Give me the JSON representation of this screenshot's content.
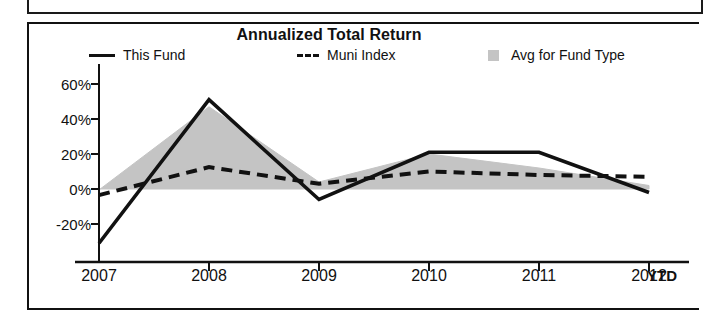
{
  "panel": {
    "frame_color": "#111111"
  },
  "chart_data": {
    "type": "line",
    "title": "Annualized Total Return",
    "xlabel": "",
    "ylabel": "",
    "x": [
      "2007",
      "2008",
      "2009",
      "2010",
      "2011",
      "2012"
    ],
    "categories": [
      "2007",
      "2008",
      "2009",
      "2010",
      "2011",
      "2012"
    ],
    "x_axis_note": "YTD",
    "ylim": [
      -32,
      62
    ],
    "yticks": [
      60,
      40,
      20,
      0,
      -20
    ],
    "ytick_labels": [
      "60%",
      "40%",
      "20%",
      "0%",
      "-20%"
    ],
    "grid": false,
    "legend_position": "top",
    "series": [
      {
        "name": "This Fund",
        "style": "solid",
        "color": "#111111",
        "values": [
          -31,
          51,
          -6,
          21,
          21,
          -2
        ]
      },
      {
        "name": "Muni Index",
        "style": "dashed",
        "color": "#111111",
        "values": [
          -3.5,
          12.5,
          3,
          10,
          8,
          7
        ]
      },
      {
        "name": "Avg for Fund Type",
        "style": "area",
        "color": "#c4c4c4",
        "values": [
          -0.5,
          47,
          4,
          20,
          12,
          2
        ]
      }
    ]
  },
  "legend": {
    "items": [
      {
        "label": "This Fund",
        "swatch": "solid-line-swatch"
      },
      {
        "label": "Muni Index",
        "swatch": "dashed-line-swatch"
      },
      {
        "label": "Avg for Fund Type",
        "swatch": "area-fill-swatch"
      }
    ]
  }
}
